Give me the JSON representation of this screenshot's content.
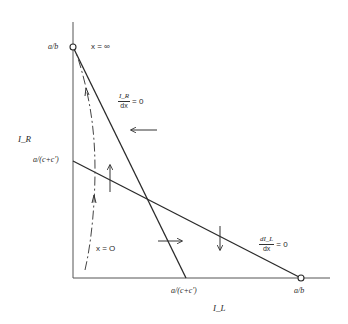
{
  "diagram": {
    "axes": {
      "y_label": "I_R",
      "x_label": "I_L",
      "y_ticks": [
        "a/b",
        "a/(c+c')"
      ],
      "x_ticks": [
        "a/(c+c')",
        "a/b"
      ]
    },
    "curves": {
      "steep_line": {
        "label_num": "I_R",
        "label_den": "dx",
        "label_eq": "= 0"
      },
      "shallow_line": {
        "label_num": "dI_L",
        "label_den": "dx",
        "label_eq": "= 0"
      }
    },
    "annotations": {
      "x_infinity": "x = ∞",
      "x_zero": "x = O"
    },
    "colors": {
      "ink": "#2a2a2a",
      "background": "#ffffff"
    }
  }
}
